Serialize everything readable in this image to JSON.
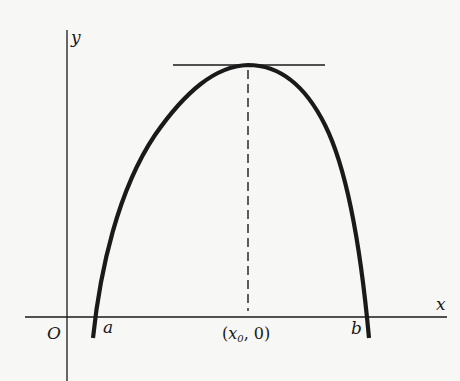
{
  "diagram": {
    "axes": {
      "x_label": "x",
      "y_label": "y",
      "origin_label": "O"
    },
    "points": {
      "a_label": "a",
      "b_label": "b",
      "x0_label_open": "(",
      "x0_label_var": "x",
      "x0_label_sub": "0",
      "x0_label_close": ", 0)"
    },
    "elements": [
      {
        "type": "curve",
        "name": "concave-down curve",
        "from": "a",
        "to": "b",
        "peak": "x0"
      },
      {
        "type": "line",
        "name": "horizontal tangent at maximum"
      },
      {
        "type": "dashed-line",
        "name": "vertical from maximum to (x0, 0)"
      }
    ],
    "colors": {
      "ink": "#1a1a1a",
      "background": "#f7f7f5"
    }
  }
}
